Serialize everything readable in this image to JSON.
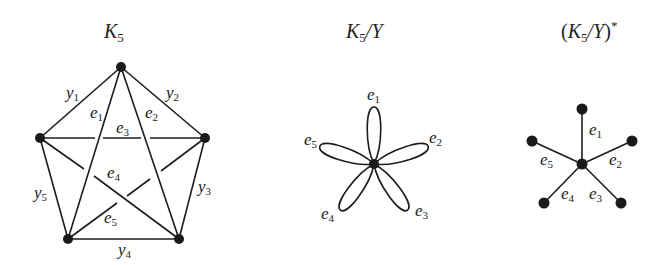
{
  "panels": [
    {
      "id": "k5",
      "title": {
        "main": "K",
        "sub": "5",
        "suffix": ""
      },
      "vertices": [
        {
          "name": "top",
          "x": 121,
          "y": 67
        },
        {
          "name": "left",
          "x": 40,
          "y": 138
        },
        {
          "name": "right",
          "x": 205,
          "y": 138
        },
        {
          "name": "bottom-left",
          "x": 68,
          "y": 239
        },
        {
          "name": "bottom-right",
          "x": 179,
          "y": 239
        }
      ],
      "edge_labels": {
        "y1": {
          "main": "y",
          "sub": "1"
        },
        "y2": {
          "main": "y",
          "sub": "2"
        },
        "y3": {
          "main": "y",
          "sub": "3"
        },
        "y4": {
          "main": "y",
          "sub": "4"
        },
        "y5": {
          "main": "y",
          "sub": "5"
        },
        "e1": {
          "main": "e",
          "sub": "1"
        },
        "e2": {
          "main": "e",
          "sub": "2"
        },
        "e3": {
          "main": "e",
          "sub": "3"
        },
        "e4": {
          "main": "e",
          "sub": "4"
        },
        "e5": {
          "main": "e",
          "sub": "5"
        }
      }
    },
    {
      "id": "k5-quotient-y",
      "title": {
        "main": "K",
        "sub": "5",
        "suffix": "/Y"
      },
      "center": {
        "x": 374,
        "y": 164
      },
      "loops": [
        {
          "name": "e1",
          "main": "e",
          "sub": "1"
        },
        {
          "name": "e2",
          "main": "e",
          "sub": "2"
        },
        {
          "name": "e3",
          "main": "e",
          "sub": "3"
        },
        {
          "name": "e4",
          "main": "e",
          "sub": "4"
        },
        {
          "name": "e5",
          "main": "e",
          "sub": "5"
        }
      ]
    },
    {
      "id": "k5-quotient-y-dual",
      "title": {
        "open": "(",
        "main": "K",
        "sub": "5",
        "suffix": "/Y",
        "close": ")",
        "sup": "*"
      },
      "center": {
        "x": 582,
        "y": 164
      },
      "spokes": [
        {
          "name": "e1",
          "main": "e",
          "sub": "1"
        },
        {
          "name": "e2",
          "main": "e",
          "sub": "2"
        },
        {
          "name": "e3",
          "main": "e",
          "sub": "3"
        },
        {
          "name": "e4",
          "main": "e",
          "sub": "4"
        },
        {
          "name": "e5",
          "main": "e",
          "sub": "5"
        }
      ]
    }
  ],
  "colors": {
    "ink": "#1c1c1c",
    "background": "#ffffff"
  }
}
